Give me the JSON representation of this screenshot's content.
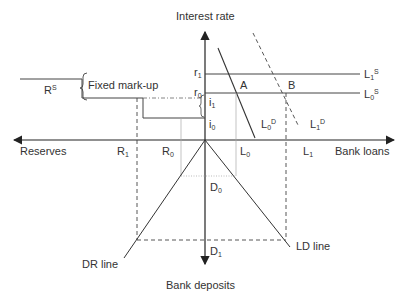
{
  "axes": {
    "vertical_top_label": "Interest rate",
    "vertical_bottom_label": "Bank deposits",
    "horizontal_left_label": "Reserves",
    "horizontal_right_label": "Bank loans"
  },
  "annotations": {
    "fixed_markup": "Fixed mark-up",
    "reserve_supply": {
      "base": "R",
      "sup": "S"
    },
    "point_a": "A",
    "point_b": "B",
    "dr_line": "DR line",
    "ld_line": "LD line"
  },
  "rate_labels": {
    "r1": {
      "base": "r",
      "sub": "1"
    },
    "r0": {
      "base": "r",
      "sub": "0"
    },
    "i1": {
      "base": "i",
      "sub": "1"
    },
    "i0": {
      "base": "i",
      "sub": "0"
    }
  },
  "curve_labels": {
    "l1s": {
      "base": "L",
      "sub": "1",
      "sup": "S"
    },
    "l0s": {
      "base": "L",
      "sub": "0",
      "sup": "S"
    },
    "l0d": {
      "base": "L",
      "sub": "0",
      "sup": "D"
    },
    "l1d": {
      "base": "L",
      "sub": "1",
      "sup": "D"
    }
  },
  "quantity_labels": {
    "r1": {
      "base": "R",
      "sub": "1"
    },
    "r0": {
      "base": "R",
      "sub": "0"
    },
    "l0": {
      "base": "L",
      "sub": "0"
    },
    "l1": {
      "base": "L",
      "sub": "1"
    },
    "d0": {
      "base": "D",
      "sub": "0"
    },
    "d1": {
      "base": "D",
      "sub": "1"
    }
  },
  "colors": {
    "line": "#333333",
    "guide": "#aaaaaa",
    "text": "#333333"
  }
}
